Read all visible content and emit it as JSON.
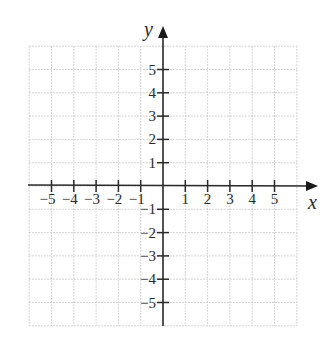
{
  "diagram": {
    "type": "coordinate-plane",
    "x_axis_label": "x",
    "y_axis_label": "y",
    "x_tick_labels": [
      "−5",
      "−4",
      "−3",
      "−2",
      "−1",
      "1",
      "2",
      "3",
      "4",
      "5"
    ],
    "x_tick_values": [
      -5,
      -4,
      -3,
      -2,
      -1,
      1,
      2,
      3,
      4,
      5
    ],
    "y_tick_labels": [
      "5",
      "4",
      "3",
      "2",
      "1",
      "−1",
      "−2",
      "−3",
      "−4",
      "−5"
    ],
    "y_tick_values": [
      5,
      4,
      3,
      2,
      1,
      -1,
      -2,
      -3,
      -4,
      -5
    ],
    "grid": {
      "min": -6,
      "max": 6,
      "style": "dotted"
    },
    "colors": {
      "axis": "#2a2a2a",
      "grid": "#c8c8c8",
      "background": "#ffffff"
    }
  }
}
